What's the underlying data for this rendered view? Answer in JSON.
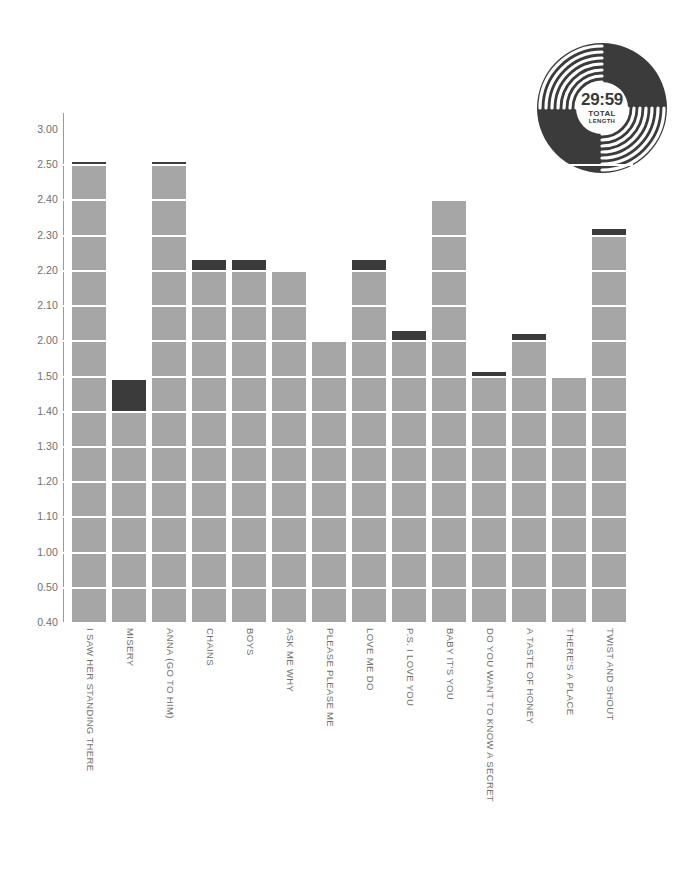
{
  "badge": {
    "name": "vinyl-record-badge",
    "time": "29:59",
    "caption_line1": "TOTAL",
    "caption_line2": "LENGTH"
  },
  "colors": {
    "bar_body": "#a6a6a6",
    "bar_cap": "#3b3b3b",
    "axis": "#9a9a9a",
    "text": "#6f6f6f",
    "grid": "#ffffff",
    "background": "#ffffff"
  },
  "chart_data": {
    "type": "bar",
    "title": "",
    "subtitle": "",
    "xlabel": "",
    "ylabel": "",
    "grid": true,
    "legend": "none",
    "note": "Bar heights are track running times shown as minutes.seconds on a broken axis; the dark cap on each bar marks the seconds beyond the last whole-tick value.",
    "ylim": [
      0.4,
      3.0
    ],
    "ytick_labels": [
      "3.00",
      "2.50",
      "2.40",
      "2.30",
      "2.20",
      "2.10",
      "2.00",
      "1.50",
      "1.40",
      "1.30",
      "1.20",
      "1.10",
      "1.00",
      "0.50",
      "0.40"
    ],
    "ytick_positions": [
      3.0,
      2.5,
      2.4,
      2.3,
      2.2,
      2.1,
      2.0,
      1.5,
      1.4,
      1.3,
      1.2,
      1.1,
      1.0,
      0.5,
      0.4
    ],
    "categories": [
      "I SAW HER STANDING THERE",
      "MISERY",
      "ANNA (GO TO HIM)",
      "CHAINS",
      "BOYS",
      "ASK ME WHY",
      "PLEASE PLEASE ME",
      "LOVE ME DO",
      "P.S. I LOVE YOU",
      "BABY IT'S YOU",
      "DO YOU WANT TO KNOW A SECRET",
      "A TASTE OF HONEY",
      "THERE'S A PLACE",
      "TWIST AND SHOUT"
    ],
    "values": [
      2.55,
      1.49,
      2.55,
      2.23,
      2.23,
      2.2,
      2.0,
      2.23,
      2.03,
      2.4,
      1.57,
      2.02,
      1.51,
      2.32
    ],
    "base_values": [
      2.5,
      1.4,
      2.5,
      2.2,
      2.2,
      2.2,
      2.0,
      2.2,
      2.0,
      2.4,
      1.5,
      2.0,
      1.5,
      2.3
    ],
    "series": [
      {
        "name": "whole minutes segment",
        "color": "#a6a6a6",
        "values": [
          2.5,
          1.4,
          2.5,
          2.2,
          2.2,
          2.2,
          2.0,
          2.2,
          2.0,
          2.4,
          1.5,
          2.0,
          1.5,
          2.3
        ]
      },
      {
        "name": "seconds remainder cap",
        "color": "#3b3b3b",
        "values": [
          0.05,
          0.09,
          0.05,
          0.03,
          0.03,
          0.0,
          0.0,
          0.03,
          0.03,
          0.0,
          0.07,
          0.02,
          0.01,
          0.02
        ]
      }
    ]
  }
}
